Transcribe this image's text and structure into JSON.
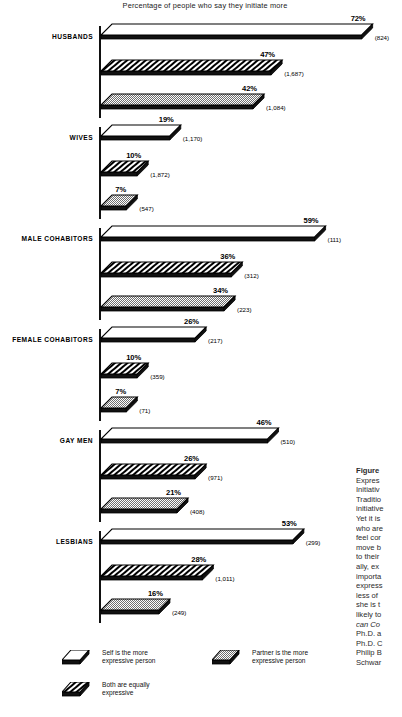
{
  "chart_data": {
    "type": "bar",
    "title": "Percentage of people who say they initiate more",
    "xlabel": "",
    "ylabel": "",
    "xlim": [
      0,
      75
    ],
    "grid": false,
    "legend_position": "bottom",
    "categories": [
      "HUSBANDS",
      "WIVES",
      "MALE COHABITORS",
      "FEMALE COHABITORS",
      "GAY MEN",
      "LESBIANS"
    ],
    "series": [
      {
        "name": "Self is the more expressive person",
        "pattern": "white",
        "values": [
          72,
          19,
          59,
          26,
          46,
          53
        ],
        "n": [
          "(824)",
          "(1,170)",
          "(111)",
          "(217)",
          "(510)",
          "(299)"
        ],
        "labels": [
          "72%",
          "19%",
          "59%",
          "26%",
          "46%",
          "53%"
        ]
      },
      {
        "name": "Both are equally expressive",
        "pattern": "diagonal-hatch",
        "values": [
          47,
          10,
          36,
          10,
          26,
          28
        ],
        "n": [
          "(1,687)",
          "(1,872)",
          "(312)",
          "(359)",
          "(971)",
          "(1,011)"
        ],
        "labels": [
          "47%",
          "10%",
          "36%",
          "10%",
          "26%",
          "28%"
        ]
      },
      {
        "name": "Partner is the more expressive person",
        "pattern": "checker-gray",
        "values": [
          42,
          7,
          34,
          7,
          21,
          16
        ],
        "n": [
          "(1,084)",
          "(547)",
          "(223)",
          "(71)",
          "(408)",
          "(249)"
        ],
        "labels": [
          "42%",
          "7%",
          "34%",
          "7%",
          "21%",
          "16%"
        ]
      }
    ]
  },
  "legend": {
    "items": [
      {
        "label": "Self is the more\nexpressive person",
        "pattern": "white"
      },
      {
        "label": "Partner is the more\nexpressive person",
        "pattern": "checker-gray"
      },
      {
        "label": "Both are equally\nexpressive",
        "pattern": "diagonal-hatch"
      }
    ]
  },
  "caption": {
    "heading": "Figure",
    "lines": [
      "Expres",
      "Initiativ",
      "Traditio",
      "initiative",
      "Yet it is",
      "who are",
      "feel cor",
      "move b",
      "to their",
      "ally, ex",
      "importa",
      "express",
      "less of",
      "she is t",
      "likely to",
      "can Co",
      "Ph.D. a",
      "Ph.D. C",
      "Philip B",
      "Schwar"
    ]
  },
  "colors": {
    "ink": "#000000",
    "shadow": "#111111",
    "fill_white": "#ffffff",
    "fill_gray": "#c9c9c9",
    "hatch": "#000000",
    "background": "#ffffff"
  }
}
